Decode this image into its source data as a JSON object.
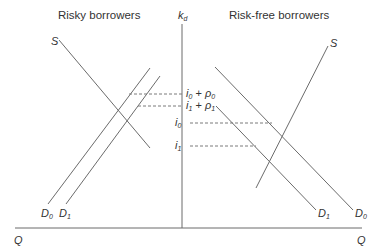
{
  "titles": {
    "left": "Risky borrowers",
    "right": "Risk-free borrowers"
  },
  "axes": {
    "vertical": {
      "base": "k",
      "sub": "d"
    },
    "horizontal_left": "Q",
    "horizontal_right": "Q"
  },
  "curves": {
    "left_supply": "S",
    "right_supply": "S",
    "left_d0": {
      "base": "D",
      "sub": "0"
    },
    "left_d1": {
      "base": "D",
      "sub": "1"
    },
    "right_d1": {
      "base": "D",
      "sub": "1"
    },
    "right_d0": {
      "base": "D",
      "sub": "0"
    }
  },
  "rate_labels": [
    {
      "text_a": "i",
      "sub_a": "0",
      "op": " + ",
      "text_b": "ρ",
      "sub_b": "0"
    },
    {
      "text_a": "i",
      "sub_a": "1",
      "op": " + ",
      "text_b": "ρ",
      "sub_b": "1"
    },
    {
      "text_a": "i",
      "sub_a": "0"
    },
    {
      "text_a": "i",
      "sub_a": "1"
    }
  ],
  "colors": {
    "line": "#6b6b6b",
    "dash": "#7a7a7a",
    "text": "#333333"
  }
}
